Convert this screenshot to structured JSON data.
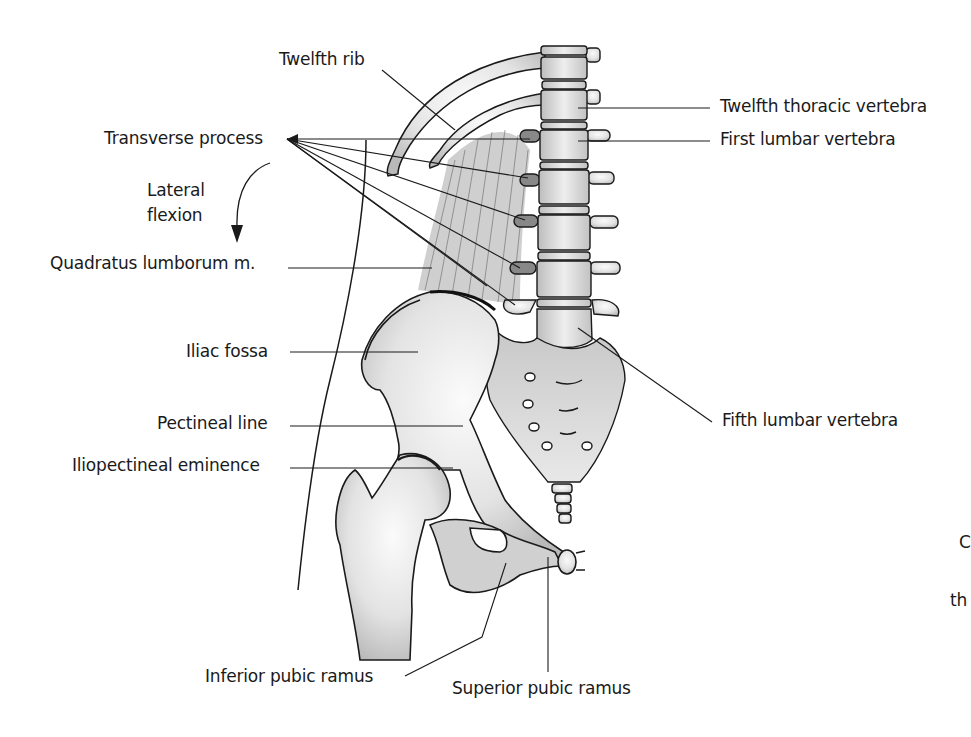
{
  "figure": {
    "type": "anatomical illustration",
    "labels": {
      "twelfth_rib": "Twelfth rib",
      "transverse_process": "Transverse process",
      "lateral_flexion_1": "Lateral",
      "lateral_flexion_2": "flexion",
      "quadratus_lumborum": "Quadratus lumborum m.",
      "iliac_fossa": "Iliac fossa",
      "pectineal_line": "Pectineal line",
      "iliopectineal_eminence": "Iliopectineal eminence",
      "inferior_pubic_ramus": "Inferior pubic ramus",
      "superior_pubic_ramus": "Superior pubic ramus",
      "twelfth_thoracic_vertebra": "Twelfth thoracic vertebra",
      "first_lumbar_vertebra": "First lumbar vertebra",
      "fifth_lumbar_vertebra": "Fifth lumbar vertebra"
    },
    "clipped_text": {
      "c_fragment": "C",
      "th_fragment": "th"
    },
    "colors": {
      "line": "#1a1a1a",
      "bone_fill": "#e6e6e6",
      "bone_shade": "#b5b5b5",
      "muscle": "#9a9a9a",
      "background": "#ffffff"
    }
  }
}
